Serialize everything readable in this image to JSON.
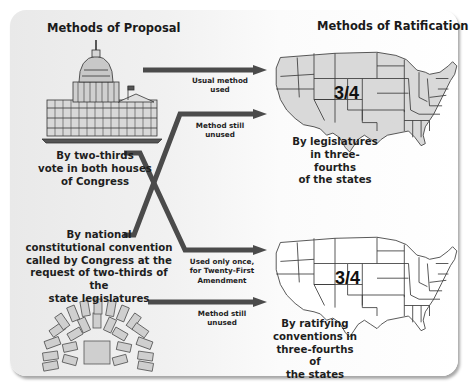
{
  "diagram": {
    "left_heading": "Methods of Proposal",
    "right_heading": "Methods of Ratification",
    "proposal_methods": [
      {
        "id": "congress",
        "label": "By two-thirds vote in both houses of Congress",
        "lines": [
          "By two-thirds",
          "vote in both houses",
          "of Congress"
        ],
        "icon": "capitol-building-icon"
      },
      {
        "id": "convention",
        "label": "By national constitutional convention called by Congress at the request of two-thirds of the state legislatures",
        "lines": [
          "By national",
          "constitutional convention",
          "called by Congress at the",
          "request of two-thirds of the",
          "state legislatures"
        ],
        "icon": "convention-seating-icon"
      }
    ],
    "ratification_methods": [
      {
        "id": "legislatures",
        "fraction": "3/4",
        "lines": [
          "By legislatures",
          "in three-fourths",
          "of the states"
        ],
        "icon": "us-map-shaded-icon"
      },
      {
        "id": "conventions",
        "fraction": "3/4",
        "lines": [
          "By ratifying",
          "conventions in",
          "three-fourths of",
          "the states"
        ],
        "icon": "us-map-outline-icon"
      }
    ],
    "arrows": [
      {
        "from": "congress",
        "to": "legislatures",
        "lines": [
          "Usual method",
          "used"
        ]
      },
      {
        "from": "convention",
        "to": "legislatures",
        "lines": [
          "Method still",
          "unused"
        ]
      },
      {
        "from": "congress",
        "to": "conventions",
        "lines": [
          "Used only once,",
          "for Twenty-First",
          "Amendment"
        ]
      },
      {
        "from": "convention",
        "to": "conventions",
        "lines": [
          "Method still",
          "unused"
        ]
      }
    ],
    "colors": {
      "arrow": "#4b4b4b",
      "map_fill_top": "#d9d9d9",
      "map_fill_bottom": "#ffffff",
      "map_stroke": "#3a3a3a",
      "text": "#1e1e1e"
    }
  }
}
